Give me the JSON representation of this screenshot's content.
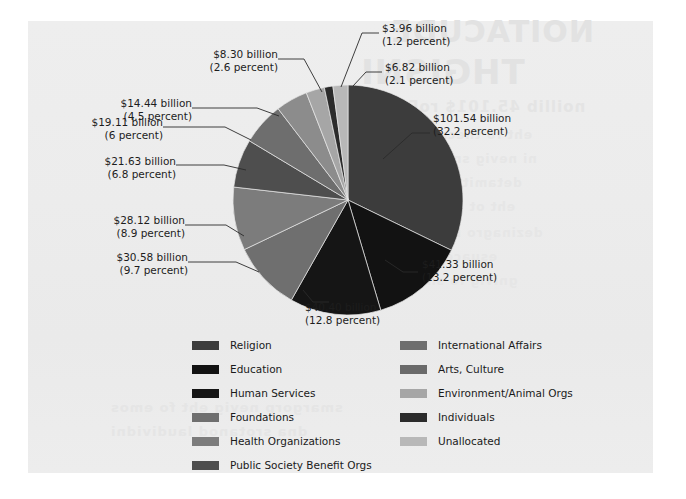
{
  "page": {
    "background_color": "#ffffff",
    "panel_color": "#ededed",
    "bleed_through_text": [
      "NOITACUDE",
      "THGISNI",
      "noillib 45.101$ roF gnivaH",
      "eht fo tnecrep 2.23 tuoba dah",
      "ni nevig snoitanod latot eht fo",
      "detamitse na htiw ,raey taht",
      "eht ot gniviG .snoitubirtnoc",
      "dezinagro rof stnuocca noigiler",
      "esuaceb si sihT .seitirahc",
      "gnivig fo snrettap eht evres",
      "smargorp nevig eht fo emos",
      "dna srotanod laudividni",
      "snoitadnuof etaroproc"
    ]
  },
  "chart_data": {
    "type": "pie",
    "title": "",
    "unit": "billion",
    "legend_position": "bottom",
    "start_angle_deg": 0,
    "direction": "clockwise",
    "center": {
      "x": 348,
      "y": 200
    },
    "radius": 115,
    "categories": [
      "Religion",
      "Education",
      "Human Services",
      "Foundations",
      "Health Organizations",
      "Public Society Benefit Orgs",
      "International Affairs",
      "Arts, Culture",
      "Environment/Animal Orgs",
      "Individuals",
      "Unallocated"
    ],
    "values": [
      101.54,
      41.33,
      40.4,
      30.58,
      28.12,
      21.63,
      19.11,
      14.44,
      8.3,
      3.96,
      6.82
    ],
    "percents": [
      32.2,
      13.2,
      12.8,
      9.7,
      8.9,
      6.8,
      6.0,
      4.5,
      2.6,
      1.2,
      2.1
    ],
    "colors": [
      "#3c3c3c",
      "#121212",
      "#151515",
      "#6f6f6f",
      "#7c7c7c",
      "#4e4e4e",
      "#6e6e6e",
      "#8c8c8c",
      "#a6a6a6",
      "#2b2b2b",
      "#b8b8b8"
    ],
    "slices": [
      {
        "label": "Religion",
        "amount_text": "$101.54 billion",
        "percent_text": "(32.2 percent)",
        "value": 101.54,
        "percent": 32.2,
        "color": "#3c3c3c"
      },
      {
        "label": "Education",
        "amount_text": "$41.33 billion",
        "percent_text": "(13.2 percent)",
        "value": 41.33,
        "percent": 13.2,
        "color": "#121212"
      },
      {
        "label": "Human Services",
        "amount_text": "$40.40 billion",
        "percent_text": "(12.8 percent)",
        "value": 40.4,
        "percent": 12.8,
        "color": "#151515"
      },
      {
        "label": "Foundations",
        "amount_text": "$30.58 billion",
        "percent_text": "(9.7 percent)",
        "value": 30.58,
        "percent": 9.7,
        "color": "#6f6f6f"
      },
      {
        "label": "Health Organizations",
        "amount_text": "$28.12 billion",
        "percent_text": "(8.9 percent)",
        "value": 28.12,
        "percent": 8.9,
        "color": "#7c7c7c"
      },
      {
        "label": "Public Society Benefit Orgs",
        "amount_text": "$21.63 billion",
        "percent_text": "(6.8 percent)",
        "value": 21.63,
        "percent": 6.8,
        "color": "#4e4e4e"
      },
      {
        "label": "International Affairs",
        "amount_text": "$19.11 billion",
        "percent_text": "(6 percent)",
        "value": 19.11,
        "percent": 6.0,
        "color": "#6e6e6e"
      },
      {
        "label": "Arts, Culture",
        "amount_text": "$14.44 billion",
        "percent_text": "(4.5 percent)",
        "value": 14.44,
        "percent": 4.5,
        "color": "#8c8c8c"
      },
      {
        "label": "Environment/Animal Orgs",
        "amount_text": "$8.30 billion",
        "percent_text": "(2.6 percent)",
        "value": 8.3,
        "percent": 2.6,
        "color": "#a6a6a6"
      },
      {
        "label": "Individuals",
        "amount_text": "$3.96 billion",
        "percent_text": "(1.2 percent)",
        "value": 3.96,
        "percent": 1.2,
        "color": "#2b2b2b"
      },
      {
        "label": "Unallocated",
        "amount_text": "$6.82 billion",
        "percent_text": "(2.1 percent)",
        "value": 6.82,
        "percent": 2.1,
        "color": "#b8b8b8"
      }
    ]
  },
  "callouts": {
    "religion": {
      "amount": "$101.54 billion",
      "percent": "(32.2 percent)"
    },
    "education": {
      "amount": "$41.33 billion",
      "percent": "(13.2 percent)"
    },
    "human_services": {
      "amount": "$40.40 billion",
      "percent": "(12.8 percent)"
    },
    "foundations": {
      "amount": "$30.58 billion",
      "percent": "(9.7 percent)"
    },
    "health": {
      "amount": "$28.12 billion",
      "percent": "(8.9 percent)"
    },
    "public_society": {
      "amount": "$21.63 billion",
      "percent": "(6.8 percent)"
    },
    "international": {
      "amount": "$19.11 billion",
      "percent": "(6 percent)"
    },
    "arts": {
      "amount": "$14.44 billion",
      "percent": "(4.5 percent)"
    },
    "environment": {
      "amount": "$8.30 billion",
      "percent": "(2.6 percent)"
    },
    "individuals": {
      "amount": "$3.96 billion",
      "percent": "(1.2 percent)"
    },
    "unallocated": {
      "amount": "$6.82 billion",
      "percent": "(2.1 percent)"
    }
  },
  "legend": {
    "left_column": [
      {
        "label": "Religion",
        "color": "#3c3c3c"
      },
      {
        "label": "Education",
        "color": "#121212"
      },
      {
        "label": "Human Services",
        "color": "#151515"
      },
      {
        "label": "Foundations",
        "color": "#6f6f6f"
      },
      {
        "label": "Health Organizations",
        "color": "#7c7c7c"
      },
      {
        "label": "Public Society Benefit Orgs",
        "color": "#4e4e4e"
      }
    ],
    "right_column": [
      {
        "label": "International Affairs",
        "color": "#6e6e6e"
      },
      {
        "label": "Arts, Culture",
        "color": "#6a6a6a"
      },
      {
        "label": "Environment/Animal Orgs",
        "color": "#a6a6a6"
      },
      {
        "label": "Individuals",
        "color": "#2b2b2b"
      },
      {
        "label": "Unallocated",
        "color": "#b8b8b8"
      }
    ]
  }
}
